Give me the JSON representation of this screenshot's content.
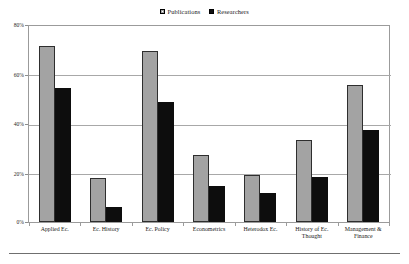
{
  "chart_data": {
    "type": "bar",
    "title": "",
    "subtitle": "",
    "xlabel": "",
    "ylabel": "",
    "ylim": [
      0,
      80
    ],
    "ytick_values": [
      0,
      20,
      40,
      60,
      80
    ],
    "ytick_labels": [
      "0%",
      "20%",
      "40%",
      "60%",
      "80%"
    ],
    "grid": true,
    "legend_position": "top-center",
    "categories": [
      "Applied Ec.",
      "Ec. History",
      "Ec. Policy",
      "Econometrics",
      "Heterodox Ec.",
      "History of Ec. Thought",
      "Management &\nFinance"
    ],
    "series": [
      {
        "name": "Publications",
        "color": "#a3a3a3",
        "values": [
          72,
          18,
          70,
          27.5,
          19,
          33.5,
          56
        ]
      },
      {
        "name": "Researchers",
        "color": "#0d0d0d",
        "values": [
          54.5,
          6,
          49,
          14.5,
          12,
          18.5,
          37.5
        ]
      }
    ]
  },
  "legend": {
    "entries": [
      {
        "label": "Publications",
        "swatch": "gray-square-icon"
      },
      {
        "label": "Researchers",
        "swatch": "black-square-icon"
      }
    ]
  },
  "axes": {
    "y_ticks": [
      "80%",
      "60%",
      "40%",
      "20%",
      "0%"
    ],
    "x_ticks": [
      "Applied Ec.",
      "Ec. History",
      "Ec. Policy",
      "Econometrics",
      "Heterodox Ec.",
      "History of Ec. Thought",
      "Management &\nFinance"
    ]
  }
}
